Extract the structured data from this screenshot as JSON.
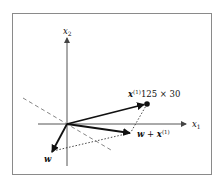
{
  "diagram": {
    "axes": {
      "x_label": "x",
      "x_label_sub": "1",
      "y_label": "x",
      "y_label_sub": "2"
    },
    "vectors": {
      "x1": {
        "label": "x",
        "superscript": "(1)",
        "annotation": "125 × 30"
      },
      "w": {
        "label": "w"
      },
      "w_plus_x": {
        "label_w": "w",
        "plus": " + ",
        "label_x": "x",
        "superscript": "(1)"
      }
    },
    "colors": {
      "frame": "#8a8a8a",
      "axis": "#555555",
      "vector": "#111111",
      "dashed": "#777777"
    }
  }
}
